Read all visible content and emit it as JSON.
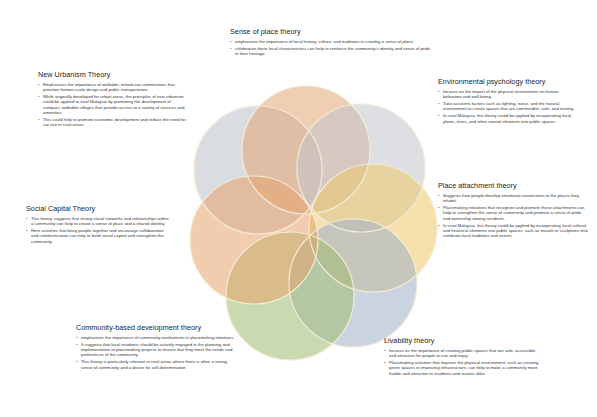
{
  "diagram": {
    "type": "overlapping-circles-rosette",
    "circles": [
      {
        "name": "new-urbanism",
        "cx": 258,
        "cy": 170,
        "r": 64,
        "color": "#b9bfc9"
      },
      {
        "name": "sense-of-place",
        "cx": 306,
        "cy": 150,
        "r": 64,
        "color": "#e2a877"
      },
      {
        "name": "environmental-psychology",
        "cx": 361,
        "cy": 168,
        "r": 64,
        "color": "#c1c5cc"
      },
      {
        "name": "place-attachment",
        "cx": 373,
        "cy": 228,
        "r": 64,
        "color": "#efc86a"
      },
      {
        "name": "livability",
        "cx": 353,
        "cy": 283,
        "r": 64,
        "color": "#9fb0c8"
      },
      {
        "name": "community-based-development",
        "cx": 290,
        "cy": 296,
        "r": 64,
        "color": "#9ebb6f"
      },
      {
        "name": "social-capital",
        "cx": 254,
        "cy": 240,
        "r": 64,
        "color": "#e8a26b"
      }
    ],
    "outline_color": "#f3ead7"
  },
  "sections": {
    "sense_of_place": {
      "title": "Sense of place theory",
      "bullets": [
        "emphasizes the importance of local history, culture, and traditions in creating a sense of place.",
        "celebration these local characteristics can help to reinforce the community's identity and sense of pride in their heritage"
      ]
    },
    "new_urbanism": {
      "title": "New Urbanism Theory",
      "bullets": [
        "Emphasises the importance of walkable, mixed-use communities that prioritize human-scale design and public transportation.",
        "While originally developed for urban areas, the principles of new urbanism could be applied to rural Malaysia by promoting the development of compact, walkable villages that provide access to a variety of services and amenities.",
        "This could help to promote economic development and reduce the need for car use in rural areas."
      ]
    },
    "environmental_psychology": {
      "title": "Environmental psychology theory",
      "bullets": [
        "focuses on the impact of the physical environment on human behaviour and well-being.",
        "Take accounts factors such as lighting, noise, and the natural environment to create spaces that are comfortable, safe, and inviting.",
        "In rural Malaysia, this theory could be applied by incorporating local plants, trees, and other natural elements into public spaces"
      ]
    },
    "place_attachment": {
      "title": "Place attachment theory",
      "bullets": [
        "Suggests how people develop emotional connections to the places they inhabit.",
        "Placemaking initiatives that recognize and promote these attachments can help to strengthen the sense of community and promote a sense of pride and ownership among residents.",
        "In rural Malaysia, this theory could be applied by incorporating local cultural and historical elements into public spaces, such as murals or sculptures that celebrate local traditions and events."
      ]
    },
    "social_capital": {
      "title": "Social Capital Theory",
      "bullets": [
        "This theory suggests that strong social networks and relationships within a community can help to create a sense of place and a shared identity.",
        "Here activities that bring people together and encourage collaboration and communication can help to build social capital and strengthen the community."
      ]
    },
    "community_based": {
      "title": "Community-based development theory",
      "bullets": [
        "emphasizes the importance of community involvement in placemaking initiatives.",
        "It suggests that local residents should be actively engaged in the planning and implementation of placemaking projects to ensure that they meet the needs and preferences of the community.",
        "This theory is particularly relevant in rural areas where there is often a strong sense of community and a desire for self-determination"
      ]
    },
    "livability": {
      "title": "Livability theory",
      "bullets": [
        "focuses on the importance of creating public spaces that are safe, accessible, and attractive for people to use and enjoy",
        "Placemaking activities that improve the physical environment, such as creating green spaces or improving infrastructure, can help to make a community more livable and attractive to residents and visitors alike."
      ]
    }
  }
}
